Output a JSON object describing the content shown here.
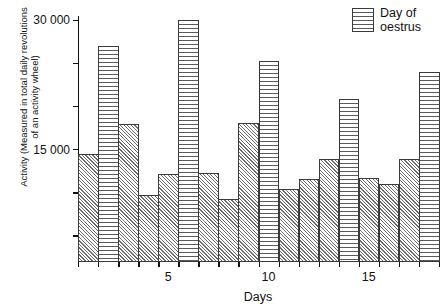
{
  "chart_data": {
    "type": "bar",
    "title": "",
    "xlabel": "Days",
    "ylabel": "Activity (Measured in total daily revolutions\nof an activity wheel)",
    "ylabel_lines": [
      "Activity (Measured in total daily revolutions",
      "of an activity wheel)"
    ],
    "ylim": [
      2000,
      30500
    ],
    "y_ticks": [
      5000,
      10000,
      15000,
      20000,
      25000,
      30000
    ],
    "y_tick_labels": [
      "",
      "",
      "15 000",
      "",
      "",
      "30 000"
    ],
    "y_labeled_ticks": [
      {
        "value": 30000,
        "label": "30 000"
      },
      {
        "value": 15000,
        "label": "15 000"
      }
    ],
    "x": [
      1,
      2,
      3,
      4,
      5,
      6,
      7,
      8,
      9,
      10,
      11,
      12,
      13,
      14,
      15,
      16,
      17,
      18
    ],
    "x_ticks": [
      5,
      10,
      15
    ],
    "x_tick_labels": [
      "5",
      "10",
      "15"
    ],
    "categories": [
      "1",
      "2",
      "3",
      "4",
      "5",
      "6",
      "7",
      "8",
      "9",
      "10",
      "11",
      "12",
      "13",
      "14",
      "15",
      "16",
      "17",
      "18"
    ],
    "values": [
      14500,
      27000,
      18000,
      9800,
      12200,
      30000,
      12300,
      9300,
      18100,
      25300,
      10500,
      11600,
      13900,
      20900,
      11700,
      11000,
      13900,
      24000
    ],
    "oestrus_days": [
      2,
      6,
      10,
      14,
      18
    ],
    "bar_fill_normal": "diagonal-hatch",
    "bar_fill_oestrus": "horizontal-hatch",
    "grid": false,
    "legend_position": "top-right",
    "legend": [
      {
        "label": "Day of\noestrus",
        "pattern": "horizontal-hatch"
      }
    ],
    "note_last_bar_clipped": true
  },
  "legend": {
    "label_line1": "Day of",
    "label_line2": "oestrus"
  },
  "axes": {
    "x_title": "Days",
    "y_title_line1": "Activity (Measured in total daily revolutions",
    "y_title_line2": "of an activity wheel)"
  },
  "colors": {
    "ink": "#111111",
    "hatch": "#5a5a5a",
    "background": "#ffffff"
  }
}
